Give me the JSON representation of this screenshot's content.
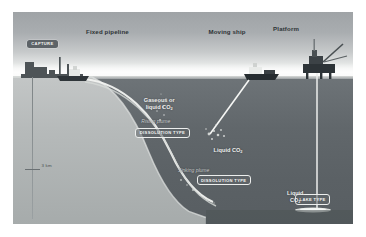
{
  "figure": {
    "headers": [
      {
        "id": "fixed-pipeline",
        "label": "Fixed pipeline"
      },
      {
        "id": "moving-ship",
        "label": "Moving ship"
      },
      {
        "id": "platform",
        "label": "Platform"
      }
    ],
    "badges": [
      {
        "id": "capture",
        "label": "CAPTURE",
        "style": "dark"
      },
      {
        "id": "dissolution-type-1",
        "label": "DISSOLUTION TYPE",
        "style": "outline"
      },
      {
        "id": "dissolution-type-2",
        "label": "DISSOLUTION TYPE",
        "style": "outline"
      },
      {
        "id": "lake-type",
        "label": "LAKE TYPE",
        "style": "outline"
      }
    ],
    "annotations": {
      "gaseous_line1": "Gaseous or",
      "gaseous_line2": "liquid CO",
      "gaseous_sub": "2",
      "rising_plume": "Rising plume",
      "liquid_co2": "Liquid CO",
      "liquid_co2_sub": "2",
      "sinking_plume": "Sinking plume",
      "lake_liquid_line1": "Liquid",
      "lake_liquid_line2": "CO",
      "lake_liquid_sub": "2"
    },
    "depth_scale": {
      "label": "3 km",
      "value": 3,
      "unit": "km"
    },
    "colors": {
      "sky_top": "#9fa3a6",
      "horizon": "#f7f7f6",
      "ocean_top": "#6e7478",
      "ocean_bottom": "#585e62",
      "land": "#b5b9ba",
      "pipeline": "#f0f1ef",
      "badge_dark": "#5d6367",
      "text_light": "#f0f1f0",
      "text_dark": "#2e3336"
    }
  }
}
